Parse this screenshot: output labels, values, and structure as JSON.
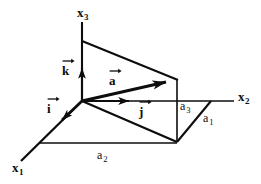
{
  "figure": {
    "background_color": "#ffffff",
    "stroke_color": "#0d0d0d",
    "axes": [
      {
        "id": "x1",
        "letter": "x",
        "subscript": "1",
        "label": "x₁"
      },
      {
        "id": "x2",
        "letter": "x",
        "subscript": "2",
        "label": "x₂"
      },
      {
        "id": "x3",
        "letter": "x",
        "subscript": "3",
        "label": "x₃"
      }
    ],
    "vectors": [
      {
        "id": "a",
        "letter": "a",
        "label": "a",
        "kind": "resultant-vector"
      },
      {
        "id": "i",
        "letter": "i",
        "label": "i",
        "kind": "unit-vector"
      },
      {
        "id": "j",
        "letter": "j",
        "label": "j",
        "kind": "unit-vector"
      },
      {
        "id": "k",
        "letter": "k",
        "label": "k",
        "kind": "unit-vector"
      }
    ],
    "components": [
      {
        "id": "a1",
        "letter": "a",
        "subscript": "1",
        "label": "a₁"
      },
      {
        "id": "a2",
        "letter": "a",
        "subscript": "2",
        "label": "a₂"
      },
      {
        "id": "a3",
        "letter": "a",
        "subscript": "3",
        "label": "a₃"
      }
    ]
  }
}
